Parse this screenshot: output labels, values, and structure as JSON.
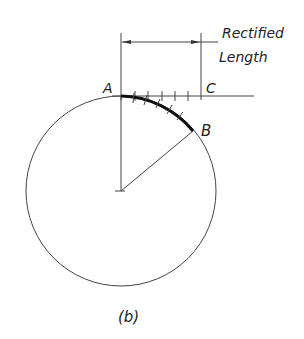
{
  "figure": {
    "caption": "(b)",
    "labels": {
      "a": "A",
      "b": "B",
      "c": "C",
      "dimension_line1": "Rectified",
      "dimension_line2": "Length"
    },
    "geometry": {
      "circle_center": [
        121,
        191
      ],
      "circle_radius": 95,
      "point_a": [
        121,
        96
      ],
      "point_b": [
        193,
        131
      ],
      "point_c": [
        201,
        96
      ],
      "tangent_line_end_x": 254,
      "dimension_y": 42,
      "tick_count": 6
    },
    "colors": {
      "stroke": "#333333",
      "arc": "#111111"
    }
  }
}
